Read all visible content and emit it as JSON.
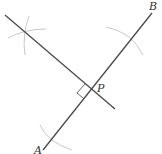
{
  "diagram": {
    "title": "",
    "labels": {
      "A": "A",
      "B": "B",
      "P": "P"
    },
    "colors": {
      "line": "#4a4a4a",
      "arc": "#c8c8c8",
      "text": "#333333",
      "background": "#ffffff"
    },
    "elements": [
      "segment AB",
      "perpendicular line through P",
      "right-angle marker at P",
      "compass arc near B",
      "compass arc near A",
      "two intersecting compass arcs (upper-left)"
    ]
  }
}
